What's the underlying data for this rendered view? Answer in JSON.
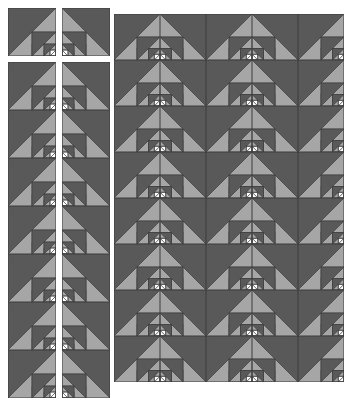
{
  "figure": {
    "background_color": "#ffffff",
    "width": 348,
    "height": 416
  },
  "palette": {
    "dark": "#595959",
    "light": "#a6a6a6",
    "white": "#ffffff",
    "outline": "#3d3d3d"
  },
  "motif": {
    "name": "recursive-right-triangle-tile",
    "description": "Square tile split by a diagonal into a dark upper-left triangle and a light lower-right triangle, with a half-scale copy of the motif nested in the lower-right quadrant, repeated for three levels of recursion ending in a white triangle.",
    "recursion_levels": 3,
    "levels": [
      {
        "level": 1,
        "fill_major": "#595959",
        "fill_minor": "#a6a6a6",
        "scale": 1.0
      },
      {
        "level": 2,
        "fill_major": "#595959",
        "fill_minor": "#a6a6a6",
        "scale": 0.5
      },
      {
        "level": 3,
        "fill_major": "#595959",
        "fill_minor": "#a6a6a6",
        "scale": 0.25
      },
      {
        "level": 4,
        "fill_major": "#ffffff",
        "fill_minor": "#ffffff",
        "scale": 0.125
      }
    ]
  },
  "layout": {
    "tile_size": 54,
    "panels": [
      {
        "name": "top-left-pair",
        "x": 8,
        "y": 8,
        "columns": 2,
        "rows": 1,
        "tile_size": 48,
        "gap": 6,
        "orientations": [
          "a",
          "b"
        ]
      },
      {
        "name": "left-column-one",
        "x": 8,
        "y": 62,
        "columns": 1,
        "rows": 7,
        "tile_size": 48,
        "gap": 0,
        "orientations": [
          "a"
        ]
      },
      {
        "name": "left-column-two",
        "x": 62,
        "y": 62,
        "columns": 1,
        "rows": 7,
        "tile_size": 48,
        "gap": 0,
        "orientations": [
          "b"
        ]
      },
      {
        "name": "main-grid",
        "x": 114,
        "y": 14,
        "columns": 5,
        "rows": 8,
        "tile_size": 46,
        "gap": 0,
        "orientations": [
          "a",
          "b",
          "a",
          "b",
          "a"
        ]
      }
    ]
  },
  "annotations": {
    "orientation_a_label": "diagonal top-right to bottom-left, nest in lower-right",
    "orientation_b_label": "mirrored diagonal, nest in upper-right"
  }
}
